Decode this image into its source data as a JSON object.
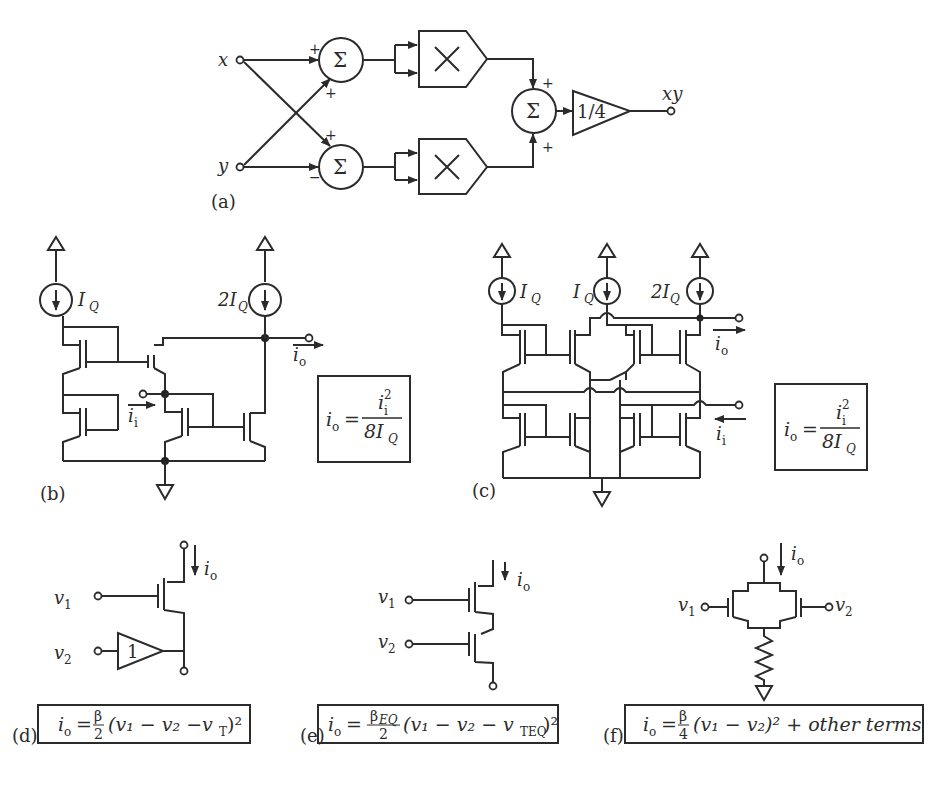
{
  "figure": {
    "panels": [
      {
        "id": "a",
        "label": "(a)"
      },
      {
        "id": "b",
        "label": "(b)"
      },
      {
        "id": "c",
        "label": "(c)"
      },
      {
        "id": "d",
        "label": "(d)"
      },
      {
        "id": "e",
        "label": "(e)"
      },
      {
        "id": "f",
        "label": "(f)"
      }
    ]
  },
  "panel_a": {
    "label": "(a)",
    "input_x": "x",
    "input_y": "y",
    "output": "xy",
    "sum_symbol": "Σ",
    "mult_symbol": "×",
    "gain": "1/4",
    "signs": {
      "top_sum_x": "+",
      "top_sum_y": "+",
      "bot_sum_x": "+",
      "bot_sum_y": "−",
      "final_top": "+",
      "final_bot": "+"
    }
  },
  "panel_b": {
    "label": "(b)",
    "source1": "I",
    "source1_sub": "Q",
    "source2_pre": "2I",
    "source2_sub": "Q",
    "out_current": "i",
    "out_sub": "o",
    "in_current": "i",
    "in_sub": "i",
    "eq_lhs": "i",
    "eq_lhs_sub": "o",
    "eq_eq": "=",
    "eq_num": "i",
    "eq_num_sub": "i",
    "eq_num_sup": "2",
    "eq_den": "8I",
    "eq_den_sub": "Q"
  },
  "panel_c": {
    "label": "(c)",
    "source1": "I",
    "source1_sub": "Q",
    "source2": "I",
    "source2_sub": "Q",
    "source3_pre": "2I",
    "source3_sub": "Q",
    "out_current": "i",
    "out_sub": "o",
    "in_current": "i",
    "in_sub": "i",
    "eq_lhs": "i",
    "eq_lhs_sub": "o",
    "eq_eq": "=",
    "eq_num": "i",
    "eq_num_sub": "i",
    "eq_num_sup": "2",
    "eq_den": "8I",
    "eq_den_sub": "Q"
  },
  "panel_d": {
    "label": "(d)",
    "v1": "v",
    "v1_sub": "1",
    "v2": "v",
    "v2_sub": "2",
    "buffer_gain": "1",
    "current": "i",
    "current_sub": "o",
    "eq_lhs": "i",
    "eq_lhs_sub": "o",
    "eq_eq": "=",
    "eq_frac_num": "β",
    "eq_frac_den": "2",
    "eq_body": "(v₁ − v₂ −v",
    "eq_body_sub": "T",
    "eq_close": ")²"
  },
  "panel_e": {
    "label": "(e)",
    "v1": "v",
    "v1_sub": "1",
    "v2": "v",
    "v2_sub": "2",
    "current": "i",
    "current_sub": "o",
    "eq_lhs": "i",
    "eq_lhs_sub": "o",
    "eq_eq": "=",
    "eq_frac_num": "β",
    "eq_frac_num_sub": "EQ",
    "eq_frac_den": "2",
    "eq_body": "(v₁ − v₂ − v",
    "eq_body_sub": "TEQ",
    "eq_close": ")²"
  },
  "panel_f": {
    "label": "(f)",
    "v1": "v",
    "v1_sub": "1",
    "v2": "v",
    "v2_sub": "2",
    "current": "i",
    "current_sub": "o",
    "eq_lhs": "i",
    "eq_lhs_sub": "o",
    "eq_eq": "=",
    "eq_frac_num": "β",
    "eq_frac_den": "4",
    "eq_body": "(v₁ − v₂)² + other terms"
  }
}
